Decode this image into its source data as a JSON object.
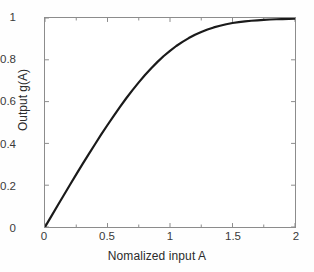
{
  "chart_data": {
    "type": "line",
    "title": "",
    "xlabel": "Nomalized input A",
    "ylabel": "Output g(A)",
    "xlim": [
      0,
      2
    ],
    "ylim": [
      0,
      1
    ],
    "xticks": [
      "0",
      "0.5",
      "1",
      "1.5",
      "2"
    ],
    "xtick_values": [
      0,
      0.5,
      1,
      1.5,
      2
    ],
    "yticks": [
      "0",
      "0.2",
      "0.4",
      "0.6",
      "0.8",
      "1"
    ],
    "ytick_values": [
      0,
      0.2,
      0.4,
      0.6,
      0.8,
      1
    ],
    "grid": false,
    "legend": "none",
    "box": true,
    "tick_direction": "in",
    "minor_xticks": [
      0.25,
      0.75,
      1.25,
      1.75
    ],
    "series": [
      {
        "name": "g(A)",
        "color": "#1a1a1a",
        "line_width": 2.2,
        "x": [
          0,
          0.05,
          0.1,
          0.15,
          0.2,
          0.25,
          0.3,
          0.35,
          0.4,
          0.45,
          0.5,
          0.55,
          0.6,
          0.65,
          0.7,
          0.75,
          0.8,
          0.85,
          0.9,
          0.95,
          1.0,
          1.05,
          1.1,
          1.15,
          1.2,
          1.25,
          1.3,
          1.35,
          1.4,
          1.45,
          1.5,
          1.55,
          1.6,
          1.65,
          1.7,
          1.75,
          1.8,
          1.85,
          1.9,
          1.95,
          2.0
        ],
        "values": [
          0.0,
          0.051,
          0.102,
          0.152,
          0.202,
          0.252,
          0.301,
          0.349,
          0.396,
          0.443,
          0.488,
          0.532,
          0.575,
          0.616,
          0.655,
          0.692,
          0.727,
          0.76,
          0.79,
          0.818,
          0.843,
          0.866,
          0.886,
          0.904,
          0.92,
          0.933,
          0.945,
          0.955,
          0.963,
          0.97,
          0.976,
          0.98,
          0.984,
          0.987,
          0.989,
          0.991,
          0.993,
          0.994,
          0.995,
          0.996,
          0.997
        ]
      }
    ]
  },
  "axes": {
    "frame_color": "#8c8c8c",
    "tick_label_color": "#3a3a3a",
    "axis_title_color": "#2b2b2b"
  }
}
